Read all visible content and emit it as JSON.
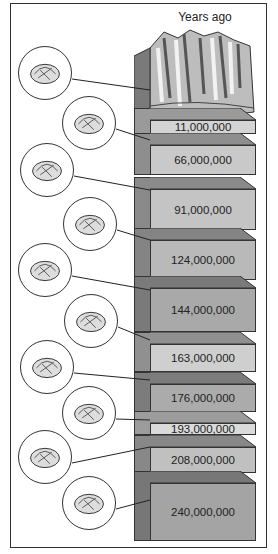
{
  "title": "Years ago",
  "layers": [
    {
      "label": "11,000,000",
      "top": 108,
      "height": 26,
      "front": "#d4d4d4",
      "side": "#9a9a9a"
    },
    {
      "label": "66,000,000",
      "top": 133,
      "height": 42,
      "front": "#c9c9c9",
      "side": "#8e8e8e"
    },
    {
      "label": "91,000,000",
      "top": 177,
      "height": 53,
      "front": "#c4c4c4",
      "side": "#8a8a8a"
    },
    {
      "label": "124,000,000",
      "top": 228,
      "height": 52,
      "front": "#b9b9b9",
      "side": "#848484"
    },
    {
      "label": "144,000,000",
      "top": 276,
      "height": 56,
      "front": "#a9a9a9",
      "side": "#7a7a7a"
    },
    {
      "label": "163,000,000",
      "top": 332,
      "height": 40,
      "front": "#cfcfcf",
      "side": "#909090"
    },
    {
      "label": "176,000,000",
      "top": 372,
      "height": 40,
      "front": "#ababab",
      "side": "#7c7c7c"
    },
    {
      "label": "193,000,000",
      "top": 411,
      "height": 24,
      "front": "#dadada",
      "side": "#9c9c9c"
    },
    {
      "label": "208,000,000",
      "top": 435,
      "height": 38,
      "front": "#c0c0c0",
      "side": "#888888"
    },
    {
      "label": "240,000,000",
      "top": 471,
      "height": 70,
      "front": "#a4a4a4",
      "side": "#777777"
    }
  ],
  "fossils": [
    {
      "name": "ammonite-fossil",
      "x": 18,
      "y": 46,
      "lx": 150,
      "ly": 90
    },
    {
      "name": "coral-fossil",
      "x": 62,
      "y": 96,
      "lx": 150,
      "ly": 140
    },
    {
      "name": "sea-urchin-fossil",
      "x": 20,
      "y": 143,
      "lx": 150,
      "ly": 190
    },
    {
      "name": "nautilus-fossil",
      "x": 63,
      "y": 197,
      "lx": 150,
      "ly": 240
    },
    {
      "name": "belemnite-fossil",
      "x": 18,
      "y": 243,
      "lx": 150,
      "ly": 290
    },
    {
      "name": "starfish-fossil",
      "x": 64,
      "y": 294,
      "lx": 150,
      "ly": 340
    },
    {
      "name": "brachiopod-fossil",
      "x": 20,
      "y": 340,
      "lx": 150,
      "ly": 380
    },
    {
      "name": "scallop-fossil",
      "x": 62,
      "y": 386,
      "lx": 150,
      "ly": 420
    },
    {
      "name": "crinoid-fossil",
      "x": 18,
      "y": 430,
      "lx": 150,
      "ly": 447
    },
    {
      "name": "gastropod-fossil",
      "x": 62,
      "y": 476,
      "lx": 150,
      "ly": 500
    }
  ]
}
